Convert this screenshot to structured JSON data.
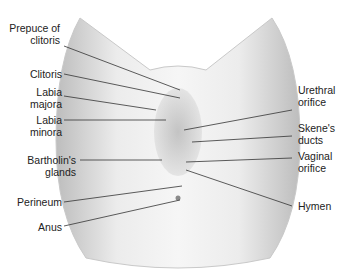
{
  "diagram": {
    "type": "anatomical-illustration",
    "colors": {
      "skin_light": "#f2f2f2",
      "skin_shade": "#c8c8c8",
      "line": "#333333",
      "text": "#222222"
    }
  },
  "labels": {
    "left": [
      {
        "id": "prepuce",
        "line1": "Prepuce of",
        "line2": "clitoris"
      },
      {
        "id": "clitoris",
        "line1": "Clitoris",
        "line2": ""
      },
      {
        "id": "labia_majora",
        "line1": "Labia",
        "line2": "majora"
      },
      {
        "id": "labia_minora",
        "line1": "Labia",
        "line2": "minora"
      },
      {
        "id": "bartholins",
        "line1": "Bartholin's",
        "line2": "glands"
      },
      {
        "id": "perineum",
        "line1": "Perineum",
        "line2": ""
      },
      {
        "id": "anus",
        "line1": "Anus",
        "line2": ""
      }
    ],
    "right": [
      {
        "id": "urethral",
        "line1": "Urethral",
        "line2": "orifice"
      },
      {
        "id": "skenes",
        "line1": "Skene's",
        "line2": "ducts"
      },
      {
        "id": "vaginal",
        "line1": "Vaginal",
        "line2": "orifice"
      },
      {
        "id": "hymen",
        "line1": "Hymen",
        "line2": ""
      }
    ]
  }
}
